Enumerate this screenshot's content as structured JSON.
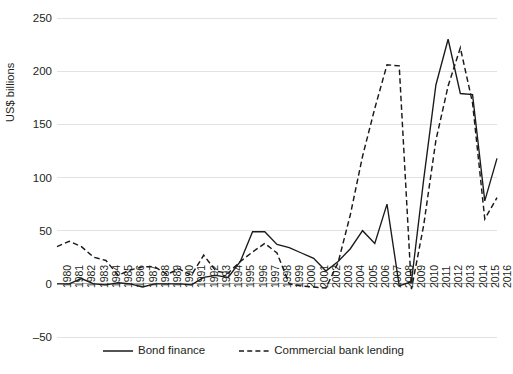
{
  "chart_data": {
    "type": "line",
    "title": "",
    "xlabel": "",
    "ylabel": "US$ billions",
    "ylim": [
      -50,
      250
    ],
    "yticks": [
      250,
      200,
      150,
      100,
      50,
      0,
      -50
    ],
    "ytick_labels": [
      "250",
      "200",
      "150",
      "100",
      "50",
      "0",
      "–50"
    ],
    "grid": true,
    "legend_position": "bottom",
    "categories": [
      "1980",
      "1981",
      "1982",
      "1983",
      "1984",
      "1985",
      "1986",
      "1987",
      "1988",
      "1989",
      "1990",
      "1991",
      "1992",
      "1993",
      "1994",
      "1995",
      "1996",
      "1997",
      "1998",
      "1999",
      "2000",
      "2001",
      "2002",
      "2003",
      "2004",
      "2005",
      "2006",
      "2007",
      "2008",
      "2009",
      "2010",
      "2011",
      "2012",
      "2013",
      "2014",
      "2015",
      "2016"
    ],
    "series": [
      {
        "name": "Bond finance",
        "style": "solid",
        "color": "#1a1a1a",
        "values": [
          0,
          0,
          5,
          0,
          -1,
          1,
          0,
          -3,
          0,
          0,
          0,
          -1,
          6,
          8,
          6,
          21,
          49,
          49,
          37,
          34,
          29,
          24,
          12,
          21,
          33,
          50,
          38,
          75,
          -2,
          2,
          98,
          187,
          230,
          179,
          178,
          78,
          118
        ]
      },
      {
        "name": "Commercial bank lending",
        "style": "dashed",
        "color": "#1a1a1a",
        "values": [
          35,
          40,
          35,
          25,
          22,
          8,
          13,
          16,
          16,
          9,
          14,
          8,
          27,
          12,
          10,
          21,
          30,
          38,
          29,
          0,
          -2,
          -3,
          -4,
          20,
          65,
          120,
          165,
          206,
          205,
          -5,
          55,
          135,
          186,
          222,
          170,
          61,
          81
        ]
      }
    ]
  },
  "legend": {
    "items": [
      {
        "label": "Bond finance",
        "style": "solid"
      },
      {
        "label": "Commercial bank lending",
        "style": "dashed"
      }
    ]
  }
}
